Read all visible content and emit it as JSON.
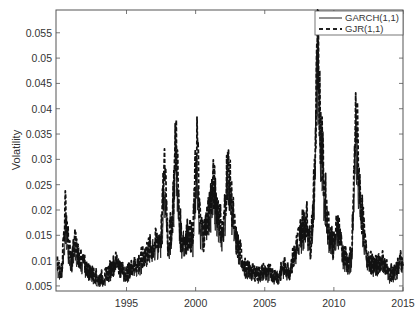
{
  "chart_data": {
    "type": "line",
    "title": "",
    "xlabel": "",
    "ylabel": "Volatility",
    "xlim": [
      1989.9,
      2015.0
    ],
    "ylim": [
      0.004,
      0.0595
    ],
    "x_ticks": [
      1995,
      2000,
      2005,
      2010,
      2015
    ],
    "x_tick_labels": [
      "1995",
      "2000",
      "2005",
      "2010",
      "2015"
    ],
    "y_ticks": [
      0.005,
      0.01,
      0.015,
      0.02,
      0.025,
      0.03,
      0.035,
      0.04,
      0.045,
      0.05,
      0.055
    ],
    "y_tick_labels": [
      "0.005",
      "0.01",
      "0.015",
      "0.02",
      "0.025",
      "0.03",
      "0.035",
      "0.04",
      "0.045",
      "0.05",
      "0.055"
    ],
    "grid": false,
    "legend_position": "upper right",
    "x": [
      1990.0,
      1990.3,
      1990.6,
      1990.8,
      1991.0,
      1991.3,
      1991.6,
      1992.0,
      1992.5,
      1993.0,
      1993.5,
      1994.0,
      1994.3,
      1994.7,
      1995.0,
      1995.5,
      1996.0,
      1996.5,
      1997.0,
      1997.5,
      1997.8,
      1998.0,
      1998.3,
      1998.6,
      1998.8,
      1999.0,
      1999.5,
      1999.8,
      2000.1,
      2000.3,
      2000.6,
      2001.0,
      2001.3,
      2001.7,
      2002.0,
      2002.3,
      2002.6,
      2002.9,
      2003.2,
      2003.6,
      2004.0,
      2004.5,
      2005.0,
      2005.5,
      2006.0,
      2006.4,
      2006.8,
      2007.2,
      2007.6,
      2008.0,
      2008.3,
      2008.6,
      2008.8,
      2009.0,
      2009.3,
      2009.6,
      2010.0,
      2010.3,
      2010.6,
      2011.0,
      2011.3,
      2011.6,
      2011.9,
      2012.3,
      2012.7,
      2013.0,
      2013.5,
      2014.0,
      2014.5,
      2014.8,
      2015.0
    ],
    "series": [
      {
        "name": "GARCH(1,1)",
        "style": "solid",
        "values": [
          0.008,
          0.0075,
          0.016,
          0.011,
          0.009,
          0.012,
          0.009,
          0.0085,
          0.007,
          0.006,
          0.0065,
          0.008,
          0.009,
          0.0075,
          0.007,
          0.0085,
          0.009,
          0.011,
          0.012,
          0.013,
          0.024,
          0.012,
          0.016,
          0.029,
          0.017,
          0.013,
          0.014,
          0.013,
          0.029,
          0.016,
          0.014,
          0.019,
          0.022,
          0.017,
          0.014,
          0.026,
          0.02,
          0.013,
          0.011,
          0.008,
          0.0075,
          0.007,
          0.0075,
          0.007,
          0.0065,
          0.008,
          0.0075,
          0.011,
          0.014,
          0.017,
          0.012,
          0.022,
          0.05,
          0.033,
          0.022,
          0.015,
          0.012,
          0.016,
          0.011,
          0.009,
          0.01,
          0.034,
          0.02,
          0.011,
          0.009,
          0.0085,
          0.0095,
          0.007,
          0.0075,
          0.009,
          0.0085
        ]
      },
      {
        "name": "GJR(1,1)",
        "style": "dashed",
        "values": [
          0.009,
          0.008,
          0.021,
          0.013,
          0.01,
          0.014,
          0.0105,
          0.009,
          0.0075,
          0.0065,
          0.007,
          0.009,
          0.01,
          0.008,
          0.0075,
          0.009,
          0.01,
          0.012,
          0.013,
          0.015,
          0.03,
          0.013,
          0.018,
          0.0355,
          0.019,
          0.014,
          0.0155,
          0.014,
          0.0352,
          0.018,
          0.015,
          0.021,
          0.025,
          0.019,
          0.015,
          0.029,
          0.022,
          0.014,
          0.012,
          0.0085,
          0.008,
          0.0075,
          0.008,
          0.0075,
          0.007,
          0.009,
          0.008,
          0.012,
          0.016,
          0.019,
          0.013,
          0.025,
          0.058,
          0.038,
          0.025,
          0.017,
          0.013,
          0.018,
          0.012,
          0.0095,
          0.011,
          0.04,
          0.023,
          0.012,
          0.0095,
          0.009,
          0.01,
          0.0075,
          0.008,
          0.01,
          0.009
        ]
      }
    ]
  },
  "legend": {
    "items": [
      {
        "label": "GARCH(1,1)",
        "style": "solid"
      },
      {
        "label": "GJR(1,1)",
        "style": "dashed"
      }
    ]
  },
  "axes": {
    "ylabel": "Volatility"
  }
}
